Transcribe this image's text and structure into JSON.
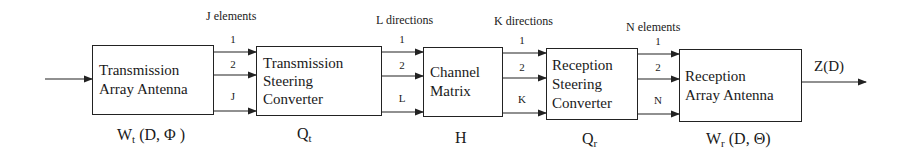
{
  "blocks": [
    {
      "id": "tx-array",
      "lines": [
        "Transmission",
        "Array Antenna"
      ],
      "symbol": "W",
      "sub": "t",
      "args": " (D, Φ )"
    },
    {
      "id": "tx-steering",
      "lines": [
        "Transmission",
        "Steering",
        "Converter"
      ],
      "symbol": "Q",
      "sub": "t",
      "args": ""
    },
    {
      "id": "channel",
      "lines": [
        "Channel",
        "Matrix"
      ],
      "symbol": "H",
      "sub": "",
      "args": ""
    },
    {
      "id": "rx-steering",
      "lines": [
        "Reception",
        "Steering",
        "Converter"
      ],
      "symbol": "Q",
      "sub": "r",
      "args": ""
    },
    {
      "id": "rx-array",
      "lines": [
        "Reception",
        "Array Antenna"
      ],
      "symbol": "W",
      "sub": "r",
      "args": " (D,  Θ)"
    }
  ],
  "links": [
    {
      "heading": "J elements",
      "indices": [
        "1",
        "2",
        "J"
      ]
    },
    {
      "heading": "L directions",
      "indices": [
        "1",
        "2",
        "L"
      ]
    },
    {
      "heading": "K directions",
      "indices": [
        "1",
        "2",
        "K"
      ]
    },
    {
      "heading": "N elements",
      "indices": [
        "1",
        "2",
        "N"
      ]
    }
  ],
  "output": {
    "label": "Z(D)"
  }
}
